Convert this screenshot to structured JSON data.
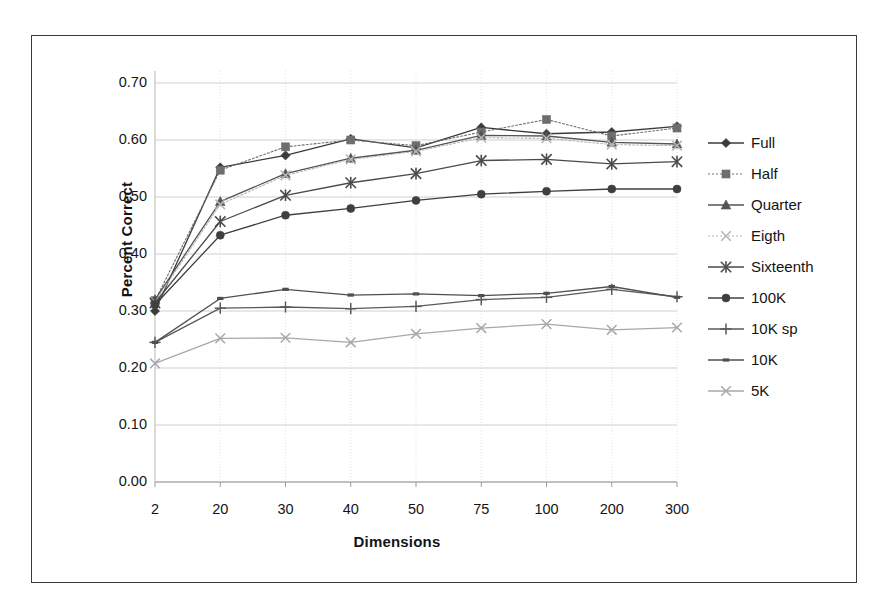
{
  "figure": {
    "y_axis_title": "Percent Correct",
    "x_axis_title": "Dimensions"
  },
  "chart_data": {
    "type": "line",
    "title": "",
    "xlabel": "Dimensions",
    "ylabel": "Percent Correct",
    "categories": [
      "2",
      "20",
      "30",
      "40",
      "50",
      "75",
      "100",
      "200",
      "300"
    ],
    "ylim": [
      0.0,
      0.7
    ],
    "ytick_labels": [
      "0.00",
      "0.10",
      "0.20",
      "0.30",
      "0.40",
      "0.50",
      "0.60",
      "0.70"
    ],
    "yticks": [
      0.0,
      0.1,
      0.2,
      0.3,
      0.4,
      0.5,
      0.6,
      0.7
    ],
    "grid": true,
    "legend_position": "right",
    "series": [
      {
        "name": "Full",
        "marker": "diamond",
        "color": "#3b3b3b",
        "line": "solid",
        "values": [
          0.3,
          0.552,
          0.573,
          0.602,
          0.586,
          0.622,
          0.611,
          0.614,
          0.624
        ]
      },
      {
        "name": "Half",
        "marker": "square",
        "color": "#6e6e6e",
        "line": "dotted",
        "values": [
          0.318,
          0.547,
          0.588,
          0.6,
          0.59,
          0.614,
          0.636,
          0.607,
          0.621
        ]
      },
      {
        "name": "Quarter",
        "marker": "triangle",
        "color": "#545454",
        "line": "solid",
        "values": [
          0.32,
          0.492,
          0.541,
          0.568,
          0.582,
          0.608,
          0.607,
          0.596,
          0.593
        ]
      },
      {
        "name": "Eigth",
        "marker": "x",
        "color": "#b5b5b5",
        "line": "dotted",
        "values": [
          0.316,
          0.487,
          0.538,
          0.566,
          0.58,
          0.604,
          0.603,
          0.592,
          0.59
        ]
      },
      {
        "name": "Sixteenth",
        "marker": "asterisk",
        "color": "#4a4a4a",
        "line": "solid",
        "values": [
          0.314,
          0.457,
          0.503,
          0.525,
          0.541,
          0.564,
          0.566,
          0.558,
          0.562
        ]
      },
      {
        "name": "100K",
        "marker": "circle",
        "color": "#3f3f3f",
        "line": "solid",
        "values": [
          0.311,
          0.433,
          0.468,
          0.48,
          0.494,
          0.505,
          0.51,
          0.514,
          0.514
        ]
      },
      {
        "name": "10K sp",
        "marker": "plus",
        "color": "#5a5a5a",
        "line": "solid",
        "values": [
          0.245,
          0.305,
          0.307,
          0.304,
          0.308,
          0.32,
          0.324,
          0.338,
          0.325
        ]
      },
      {
        "name": "10K",
        "marker": "dash",
        "color": "#4f4f4f",
        "line": "solid",
        "values": [
          0.245,
          0.322,
          0.338,
          0.328,
          0.33,
          0.327,
          0.331,
          0.343,
          0.324
        ]
      },
      {
        "name": "5K",
        "marker": "x",
        "color": "#a8a8a8",
        "line": "solid",
        "values": [
          0.208,
          0.252,
          0.253,
          0.245,
          0.26,
          0.27,
          0.277,
          0.267,
          0.271
        ]
      }
    ]
  },
  "legend": {
    "items": [
      {
        "label": "Full"
      },
      {
        "label": "Half"
      },
      {
        "label": "Quarter"
      },
      {
        "label": "Eigth"
      },
      {
        "label": "Sixteenth"
      },
      {
        "label": "100K"
      },
      {
        "label": "10K sp"
      },
      {
        "label": "10K"
      },
      {
        "label": "5K"
      }
    ]
  }
}
